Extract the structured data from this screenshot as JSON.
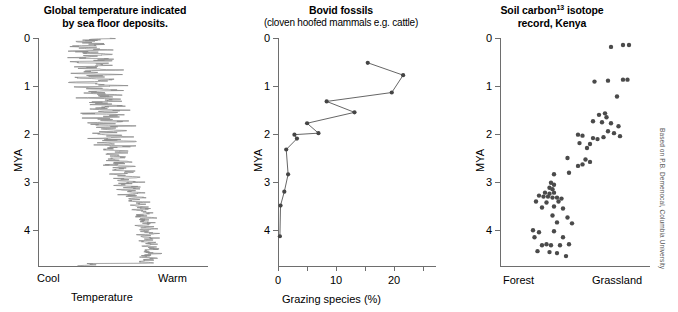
{
  "figure": {
    "credit": "Based on P.B. Demenocal, Columbia University"
  },
  "panels": {
    "temperature": {
      "title_line1": "Global temperature indicated",
      "title_line2": "by sea floor deposits.",
      "y_axis_label": "MYA",
      "x_axis_label": "Temperature",
      "x_left_label": "Cool",
      "x_right_label": "Warm",
      "y_ticks": [
        "0",
        "1",
        "2",
        "3",
        "4"
      ]
    },
    "bovid": {
      "title_line1": "Bovid fossils",
      "title_line2": "(cloven hoofed mammals e.g. cattle)",
      "y_axis_label": "MYA",
      "x_axis_label": "Grazing species (%)",
      "y_ticks": [
        "0",
        "1",
        "2",
        "3",
        "4"
      ],
      "x_ticks": [
        "0",
        "10",
        "20"
      ]
    },
    "soil": {
      "title_line1_pre": "Soil carbon",
      "title_line1_sup": "13",
      "title_line1_post": " isotope",
      "title_line2": "record, Kenya",
      "y_axis_label": "MYA",
      "x_left_label": "Forest",
      "x_right_label": "Grassland",
      "y_ticks": [
        "0",
        "1",
        "2",
        "3",
        "4"
      ]
    }
  },
  "chart_data": [
    {
      "type": "line",
      "id": "global-temperature",
      "title": "Global temperature indicated by sea floor deposits.",
      "xlabel": "Temperature",
      "ylabel": "MYA",
      "xlim": [
        0,
        1
      ],
      "ylim": [
        4.6,
        0
      ],
      "x_axis_type": "qualitative",
      "x_endpoints": [
        "Cool",
        "Warm"
      ],
      "grid": false,
      "legend": "none",
      "description": "High frequency oscillating temperature proxy trace; mean shifts from warm at 4.5 MYA toward cool at present, with amplitude of glacial cycles increasing after 1 MYA.",
      "trace_mean": [
        {
          "mya": 4.55,
          "temp": 0.62
        },
        {
          "mya": 4.3,
          "temp": 0.66
        },
        {
          "mya": 4.0,
          "temp": 0.64
        },
        {
          "mya": 3.7,
          "temp": 0.63
        },
        {
          "mya": 3.4,
          "temp": 0.6
        },
        {
          "mya": 3.1,
          "temp": 0.55
        },
        {
          "mya": 2.8,
          "temp": 0.51
        },
        {
          "mya": 2.5,
          "temp": 0.47
        },
        {
          "mya": 2.2,
          "temp": 0.44
        },
        {
          "mya": 1.9,
          "temp": 0.42
        },
        {
          "mya": 1.6,
          "temp": 0.4
        },
        {
          "mya": 1.3,
          "temp": 0.39
        },
        {
          "mya": 1.0,
          "temp": 0.37
        },
        {
          "mya": 0.7,
          "temp": 0.34
        },
        {
          "mya": 0.4,
          "temp": 0.31
        },
        {
          "mya": 0.1,
          "temp": 0.3
        }
      ]
    },
    {
      "type": "line",
      "id": "bovid-fossils",
      "title": "Bovid fossils (cloven hoofed mammals e.g. cattle)",
      "xlabel": "Grazing species (%)",
      "ylabel": "MYA",
      "xlim": [
        0,
        25
      ],
      "ylim": [
        4.6,
        0
      ],
      "x_ticks": [
        0,
        5,
        10,
        15,
        20,
        25
      ],
      "x_tick_labels": [
        "0",
        "",
        "10",
        "",
        "20",
        ""
      ],
      "y_ticks": [
        0,
        1,
        2,
        3,
        4
      ],
      "grid": false,
      "legend": "none",
      "markers": true,
      "points": [
        {
          "mya": 0.5,
          "grazing": 14.2
        },
        {
          "mya": 0.75,
          "grazing": 19.8
        },
        {
          "mya": 1.1,
          "grazing": 18.0
        },
        {
          "mya": 1.28,
          "grazing": 7.7
        },
        {
          "mya": 1.5,
          "grazing": 12.1
        },
        {
          "mya": 1.72,
          "grazing": 4.6
        },
        {
          "mya": 1.92,
          "grazing": 6.4
        },
        {
          "mya": 1.95,
          "grazing": 2.6
        },
        {
          "mya": 2.03,
          "grazing": 3.0
        },
        {
          "mya": 2.25,
          "grazing": 1.3
        },
        {
          "mya": 2.75,
          "grazing": 1.6
        },
        {
          "mya": 3.1,
          "grazing": 1.0
        },
        {
          "mya": 3.38,
          "grazing": 0.4
        },
        {
          "mya": 4.0,
          "grazing": 0.3
        }
      ]
    },
    {
      "type": "scatter",
      "id": "soil-carbon-13-isotope",
      "title": "Soil carbon13 isotope record, Kenya",
      "xlabel": "",
      "ylabel": "MYA",
      "x_axis_type": "qualitative",
      "x_endpoints": [
        "Forest",
        "Grassland"
      ],
      "xlim": [
        0,
        1
      ],
      "ylim": [
        4.6,
        0
      ],
      "y_ticks": [
        0,
        1,
        2,
        3,
        4
      ],
      "grid": false,
      "legend": "none",
      "description": "Soil carbonate d13C values shift from forest-dominated C3 signatures before 3 MYA toward grassland C4 signatures after 2 MYA.",
      "points": [
        {
          "x": 0.74,
          "mya": 0.18
        },
        {
          "x": 0.82,
          "mya": 0.14
        },
        {
          "x": 0.86,
          "mya": 0.14
        },
        {
          "x": 0.63,
          "mya": 0.88
        },
        {
          "x": 0.72,
          "mya": 0.86
        },
        {
          "x": 0.82,
          "mya": 0.84
        },
        {
          "x": 0.85,
          "mya": 0.84
        },
        {
          "x": 0.78,
          "mya": 1.18
        },
        {
          "x": 0.66,
          "mya": 1.55
        },
        {
          "x": 0.7,
          "mya": 1.52
        },
        {
          "x": 0.71,
          "mya": 1.6
        },
        {
          "x": 0.62,
          "mya": 1.68
        },
        {
          "x": 0.68,
          "mya": 1.7
        },
        {
          "x": 0.74,
          "mya": 1.72
        },
        {
          "x": 0.79,
          "mya": 1.78
        },
        {
          "x": 0.72,
          "mya": 1.88
        },
        {
          "x": 0.76,
          "mya": 1.92
        },
        {
          "x": 0.52,
          "mya": 1.95
        },
        {
          "x": 0.55,
          "mya": 1.97
        },
        {
          "x": 0.62,
          "mya": 2.02
        },
        {
          "x": 0.65,
          "mya": 2.04
        },
        {
          "x": 0.69,
          "mya": 2.0
        },
        {
          "x": 0.8,
          "mya": 1.98
        },
        {
          "x": 0.53,
          "mya": 2.12
        },
        {
          "x": 0.6,
          "mya": 2.14
        },
        {
          "x": 0.58,
          "mya": 2.22
        },
        {
          "x": 0.45,
          "mya": 2.42
        },
        {
          "x": 0.57,
          "mya": 2.45
        },
        {
          "x": 0.6,
          "mya": 2.5
        },
        {
          "x": 0.52,
          "mya": 2.58
        },
        {
          "x": 0.55,
          "mya": 2.55
        },
        {
          "x": 0.36,
          "mya": 2.75
        },
        {
          "x": 0.46,
          "mya": 2.72
        },
        {
          "x": 0.34,
          "mya": 2.92
        },
        {
          "x": 0.36,
          "mya": 2.96
        },
        {
          "x": 0.33,
          "mya": 3.02
        },
        {
          "x": 0.35,
          "mya": 3.05
        },
        {
          "x": 0.3,
          "mya": 3.12
        },
        {
          "x": 0.33,
          "mya": 3.14
        },
        {
          "x": 0.36,
          "mya": 3.12
        },
        {
          "x": 0.26,
          "mya": 3.18
        },
        {
          "x": 0.29,
          "mya": 3.2
        },
        {
          "x": 0.32,
          "mya": 3.2
        },
        {
          "x": 0.35,
          "mya": 3.22
        },
        {
          "x": 0.38,
          "mya": 3.22
        },
        {
          "x": 0.41,
          "mya": 3.24
        },
        {
          "x": 0.24,
          "mya": 3.3
        },
        {
          "x": 0.31,
          "mya": 3.32
        },
        {
          "x": 0.39,
          "mya": 3.3
        },
        {
          "x": 0.28,
          "mya": 3.42
        },
        {
          "x": 0.36,
          "mya": 3.4
        },
        {
          "x": 0.42,
          "mya": 3.44
        },
        {
          "x": 0.35,
          "mya": 3.58
        },
        {
          "x": 0.45,
          "mya": 3.62
        },
        {
          "x": 0.38,
          "mya": 3.72
        },
        {
          "x": 0.48,
          "mya": 3.74
        },
        {
          "x": 0.22,
          "mya": 3.88
        },
        {
          "x": 0.26,
          "mya": 3.92
        },
        {
          "x": 0.36,
          "mya": 3.9
        },
        {
          "x": 0.23,
          "mya": 4.02
        },
        {
          "x": 0.42,
          "mya": 4.02
        },
        {
          "x": 0.28,
          "mya": 4.18
        },
        {
          "x": 0.31,
          "mya": 4.16
        },
        {
          "x": 0.34,
          "mya": 4.18
        },
        {
          "x": 0.4,
          "mya": 4.18
        },
        {
          "x": 0.46,
          "mya": 4.16
        },
        {
          "x": 0.25,
          "mya": 4.3
        },
        {
          "x": 0.33,
          "mya": 4.32
        },
        {
          "x": 0.38,
          "mya": 4.34
        },
        {
          "x": 0.44,
          "mya": 4.4
        }
      ]
    }
  ]
}
